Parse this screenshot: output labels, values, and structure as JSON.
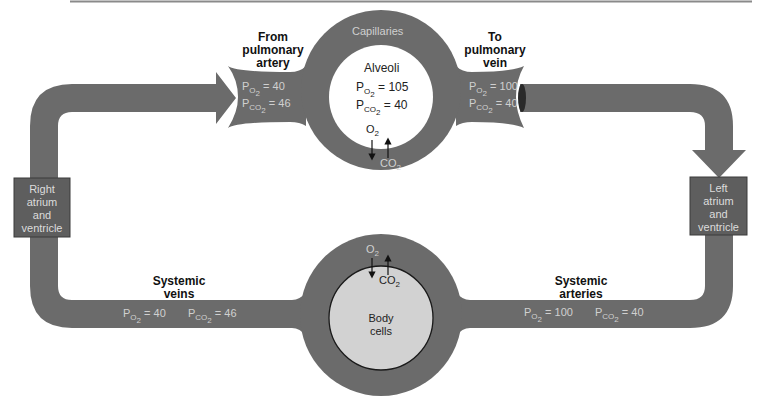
{
  "colors": {
    "vessel": "#6b6b6b",
    "vessel_dark": "#555555",
    "box": "#5e5e5e",
    "box_border": "#3a3a3a",
    "alveoli_fill": "#ffffff",
    "body_cells_fill": "#d2d2d2",
    "light_text": "#d0d0d0",
    "label_text": "#111111"
  },
  "lungs": {
    "capillaries_label": "Capillaries",
    "alveoli_label": "Alveoli",
    "alveoli_po2": "= 105",
    "alveoli_pco2": "= 40",
    "exchange_o2": "O",
    "exchange_co2": "CO"
  },
  "pulmonary_artery": {
    "label_line1": "From",
    "label_line2": "pulmonary",
    "label_line3": "artery",
    "po2": "= 40",
    "pco2": "= 46"
  },
  "pulmonary_vein": {
    "label_line1": "To",
    "label_line2": "pulmonary",
    "label_line3": "vein",
    "po2": "= 100",
    "pco2": "= 40"
  },
  "right_heart": {
    "line1": "Right",
    "line2": "atrium",
    "line3": "and",
    "line4": "ventricle"
  },
  "left_heart": {
    "line1": "Left",
    "line2": "atrium",
    "line3": "and",
    "line4": "ventricle"
  },
  "systemic_veins": {
    "label_line1": "Systemic",
    "label_line2": "veins",
    "po2": "= 40",
    "pco2": "= 46"
  },
  "systemic_arteries": {
    "label_line1": "Systemic",
    "label_line2": "arteries",
    "po2": "= 100",
    "pco2": "= 40"
  },
  "body": {
    "label_line1": "Body",
    "label_line2": "cells",
    "exchange_o2": "O",
    "exchange_co2": "CO"
  },
  "symbols": {
    "P": "P",
    "O2_sub": "O",
    "CO2_sub": "CO",
    "two": "2"
  }
}
